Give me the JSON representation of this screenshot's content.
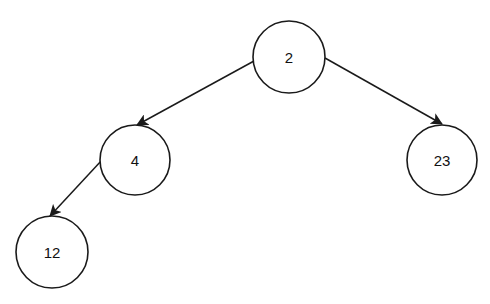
{
  "diagram": {
    "type": "binary-tree",
    "colors": {
      "background": "#ffffff",
      "stroke": "#1a1a1a",
      "text": "#111111"
    },
    "nodes": [
      {
        "id": "n2",
        "label": "2",
        "cx": 289,
        "cy": 57,
        "r": 36
      },
      {
        "id": "n4",
        "label": "4",
        "cx": 135,
        "cy": 160,
        "r": 35
      },
      {
        "id": "n23",
        "label": "23",
        "cx": 442,
        "cy": 160,
        "r": 35
      },
      {
        "id": "n12",
        "label": "12",
        "cx": 52,
        "cy": 252,
        "r": 36
      }
    ],
    "edges": [
      {
        "from": "n2",
        "to": "n4",
        "x1": 254,
        "y1": 61,
        "x2": 137,
        "y2": 125
      },
      {
        "from": "n2",
        "to": "n23",
        "x1": 325,
        "y1": 58,
        "x2": 442,
        "y2": 124
      },
      {
        "from": "n4",
        "to": "n12",
        "x1": 102,
        "y1": 160,
        "x2": 50,
        "y2": 216
      }
    ]
  }
}
